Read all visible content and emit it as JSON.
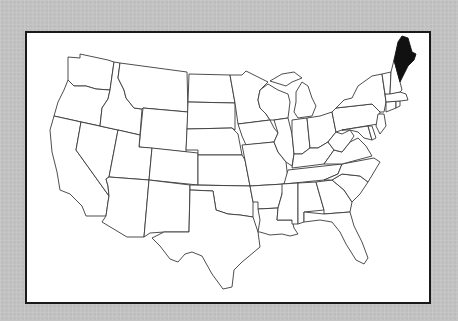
{
  "caption_partial": "",
  "map": {
    "title": "United States",
    "highlighted_state": "Maine",
    "highlight_color": "#111111",
    "base_color": "#ffffff",
    "border_color": "#1a1a1a",
    "background_color": "#c4c4c4",
    "states": [
      "Washington",
      "Oregon",
      "California",
      "Idaho",
      "Nevada",
      "Montana",
      "Wyoming",
      "Utah",
      "Arizona",
      "Colorado",
      "New Mexico",
      "North Dakota",
      "South Dakota",
      "Nebraska",
      "Kansas",
      "Oklahoma",
      "Texas",
      "Minnesota",
      "Iowa",
      "Missouri",
      "Arkansas",
      "Louisiana",
      "Wisconsin",
      "Illinois",
      "Michigan",
      "Indiana",
      "Ohio",
      "Kentucky",
      "Tennessee",
      "Mississippi",
      "Alabama",
      "Georgia",
      "Florida",
      "South Carolina",
      "North Carolina",
      "Virginia",
      "West Virginia",
      "Pennsylvania",
      "New York",
      "Maryland",
      "Delaware",
      "New Jersey",
      "Connecticut",
      "Rhode Island",
      "Massachusetts",
      "Vermont",
      "New Hampshire",
      "Maine"
    ]
  }
}
